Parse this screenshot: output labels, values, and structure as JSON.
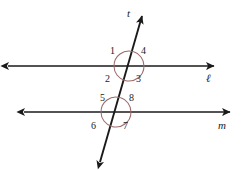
{
  "figure": {
    "type": "geometry-diagram",
    "canvas": {
      "width": 241,
      "height": 170
    },
    "background_color": "#ffffff",
    "stroke_color": "#1a1a1a",
    "arc_color": "#9c6a6a"
  },
  "lines": [
    {
      "id": "line-l",
      "label": "ℓ",
      "role": "parallel-line-upper",
      "label_x": 206,
      "label_y": 73,
      "x1": 8,
      "y1": 66,
      "x2": 214,
      "y2": 66,
      "arrow_start": true,
      "arrow_end": true
    },
    {
      "id": "line-m",
      "label": "m",
      "role": "parallel-line-lower",
      "label_x": 218,
      "label_y": 120,
      "x1": 24,
      "y1": 112,
      "x2": 230,
      "y2": 112,
      "arrow_start": true,
      "arrow_end": true
    },
    {
      "id": "line-t",
      "label": "t",
      "role": "transversal",
      "label_x": 127,
      "label_y": 8,
      "x1": 100,
      "y1": 162,
      "x2": 142,
      "y2": 16,
      "arrow_start": true,
      "arrow_end": true
    }
  ],
  "intersections": [
    {
      "id": "intersection-upper",
      "lines": [
        "line-l",
        "line-t"
      ],
      "x": 129,
      "y": 66,
      "arc_radius": 15
    },
    {
      "id": "intersection-lower",
      "lines": [
        "line-m",
        "line-t"
      ],
      "x": 116,
      "y": 112,
      "arc_radius": 15
    }
  ],
  "angles": [
    {
      "number": "1",
      "intersection": "intersection-upper",
      "position": "upper-left",
      "x": 110,
      "y": 46
    },
    {
      "number": "4",
      "intersection": "intersection-upper",
      "position": "upper-right",
      "x": 141,
      "y": 46
    },
    {
      "number": "2",
      "intersection": "intersection-upper",
      "position": "lower-left",
      "x": 105,
      "y": 74
    },
    {
      "number": "3",
      "intersection": "intersection-upper",
      "position": "lower-right",
      "x": 136,
      "y": 74
    },
    {
      "number": "5",
      "intersection": "intersection-lower",
      "position": "upper-left",
      "x": 100,
      "y": 93
    },
    {
      "number": "8",
      "intersection": "intersection-lower",
      "position": "upper-right",
      "x": 129,
      "y": 93
    },
    {
      "number": "6",
      "intersection": "intersection-lower",
      "position": "lower-left",
      "x": 91,
      "y": 121
    },
    {
      "number": "7",
      "intersection": "intersection-lower",
      "position": "lower-right",
      "x": 123,
      "y": 121
    }
  ]
}
